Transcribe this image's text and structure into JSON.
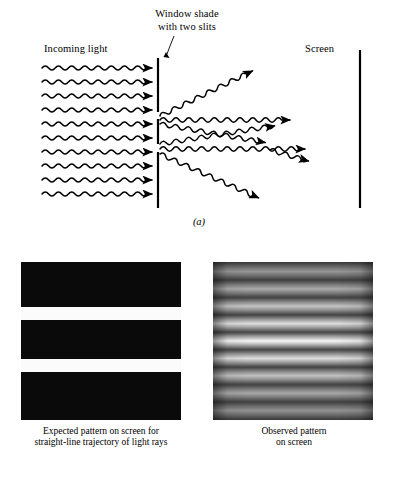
{
  "figure": {
    "title_text": "Double-slit experiment diagram",
    "background_color": "#ffffff",
    "ink_color": "#000000"
  },
  "panel_a": {
    "letter": "(a)",
    "labels": {
      "incoming_light": "Incoming light",
      "window_shade": "Window shade with two slits",
      "window_shade_line1": "Window shade",
      "window_shade_line2": "with two slits",
      "screen": "Screen"
    },
    "barrier": {
      "name": "window-shade-barrier",
      "x": 158,
      "segments": [
        {
          "y_top": 58,
          "y_bottom": 112
        },
        {
          "y_top": 118,
          "y_bottom": 145
        },
        {
          "y_top": 152,
          "y_bottom": 208
        }
      ],
      "slits": [
        {
          "label": "upper-slit",
          "y": 115
        },
        {
          "label": "lower-slit",
          "y": 148
        }
      ]
    },
    "screen_line": {
      "name": "detection-screen",
      "x": 360,
      "y_top": 50,
      "y_bottom": 208
    },
    "incoming_rays": {
      "count": 10,
      "x_start": 42,
      "x_end": 152,
      "y_first": 68,
      "y_spacing": 14,
      "direction": "rightward-horizontal"
    },
    "diffracted_rays": {
      "from_upper_slit": 3,
      "from_lower_slit": 3,
      "description": "waves fan out from each slit and overlap"
    }
  },
  "panel_b": {
    "letter": "(b)",
    "expected_pattern": {
      "caption": "Expected pattern on screen for straight-line trajectory of light rays",
      "caption_line1": "Expected pattern on screen for",
      "caption_line2": "straight-line trajectory of light rays",
      "background_color": "#0a0a0a",
      "band_color": "#fbfbfb",
      "band_count": 2,
      "bands": [
        {
          "name": "upper-bright-band",
          "top_pct": 28.5,
          "height_pct": 8.5
        },
        {
          "name": "lower-bright-band",
          "top_pct": 61.5,
          "height_pct": 8.0
        }
      ]
    },
    "observed_pattern": {
      "caption": "Observed pattern on screen",
      "caption_line1": "Observed pattern",
      "caption_line2": "on screen",
      "type": "interference-fringes",
      "fringe_count": 9,
      "brightest_fringe_index": 4,
      "fringes": [
        {
          "center_pct": 6,
          "peak_gray": 150
        },
        {
          "center_pct": 17,
          "peak_gray": 170
        },
        {
          "center_pct": 28,
          "peak_gray": 196
        },
        {
          "center_pct": 39,
          "peak_gray": 222
        },
        {
          "center_pct": 50,
          "peak_gray": 246
        },
        {
          "center_pct": 61,
          "peak_gray": 222
        },
        {
          "center_pct": 72,
          "peak_gray": 194
        },
        {
          "center_pct": 83,
          "peak_gray": 168
        },
        {
          "center_pct": 94,
          "peak_gray": 146
        }
      ],
      "dark_gray": 56,
      "edge_vignette": true
    }
  }
}
